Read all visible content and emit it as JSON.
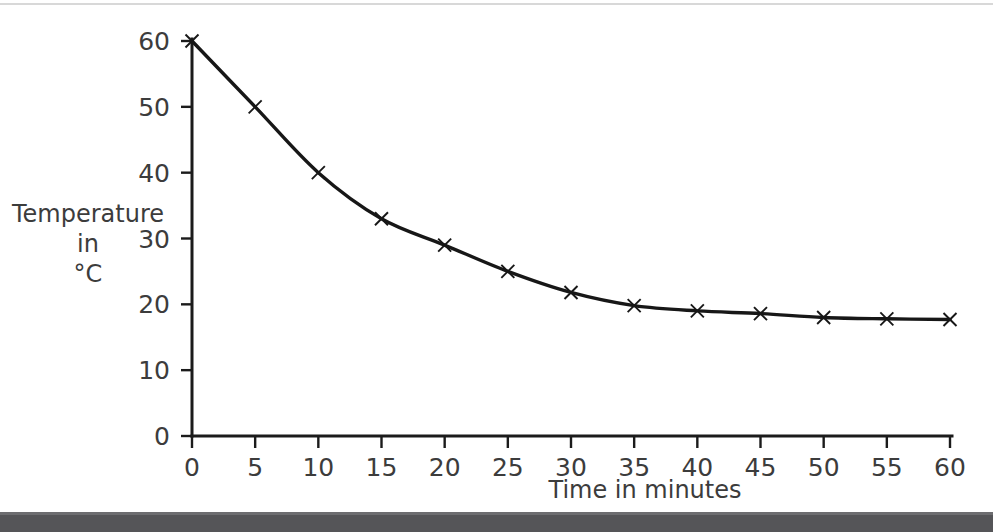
{
  "chart_data": {
    "type": "line",
    "title": "",
    "subtitle": "",
    "xlabel": "Time in minutes",
    "ylabel": "Temperature in °C",
    "ylabel_lines": [
      "Temperature",
      "in",
      "°C"
    ],
    "x": [
      0,
      5,
      10,
      15,
      20,
      25,
      30,
      35,
      40,
      45,
      50,
      55,
      60
    ],
    "values": [
      60,
      50,
      40,
      33,
      29,
      25,
      21.8,
      19.8,
      19,
      18.6,
      18,
      17.8,
      17.7
    ],
    "series": [
      {
        "name": "Temperature",
        "values": [
          60,
          50,
          40,
          33,
          29,
          25,
          21.8,
          19.8,
          19,
          18.6,
          18,
          17.8,
          17.7
        ]
      }
    ],
    "xlim": [
      0,
      60
    ],
    "ylim": [
      0,
      60
    ],
    "xticks": [
      0,
      5,
      10,
      15,
      20,
      25,
      30,
      35,
      40,
      45,
      50,
      55,
      60
    ],
    "yticks": [
      0,
      10,
      20,
      30,
      40,
      50,
      60
    ],
    "xtick_labels": [
      "0",
      "5",
      "10",
      "15",
      "20",
      "25",
      "30",
      "35",
      "40",
      "45",
      "50",
      "55",
      "60"
    ],
    "ytick_labels": [
      "0",
      "10",
      "20",
      "30",
      "40",
      "50",
      "60"
    ],
    "grid": false,
    "legend": false,
    "legend_position": "none",
    "marker": "x",
    "line_color": "#171717",
    "text_color": "#3c3c3c"
  },
  "figure": {
    "background_color": "#ffffff",
    "top_rule_color": "#d8d8d8",
    "bottom_bar_color": "#555558"
  }
}
